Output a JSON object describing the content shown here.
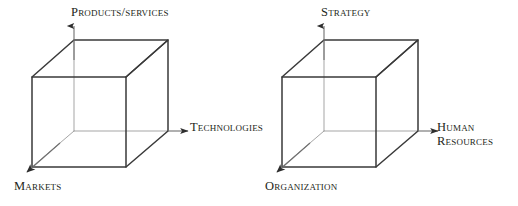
{
  "figure": {
    "type": "diagram",
    "background_color": "#ffffff",
    "stroke_color_visible": "#3a3a3a",
    "stroke_color_hidden": "#9a9a9a",
    "text_color": "#231f20"
  },
  "cubes": [
    {
      "id": "left-cube",
      "name": "business-dimensions-cube",
      "axes": [
        {
          "id": "vertical",
          "direction": "up",
          "label": "Products/services"
        },
        {
          "id": "horizontal",
          "direction": "right",
          "label": "Technologies"
        },
        {
          "id": "depth",
          "direction": "down-left",
          "label": "Markets"
        }
      ]
    },
    {
      "id": "right-cube",
      "name": "organizational-dimensions-cube",
      "axes": [
        {
          "id": "vertical",
          "direction": "up",
          "label": "Strategy"
        },
        {
          "id": "horizontal",
          "direction": "right",
          "label_line1": "Human",
          "label_line2": "Resources"
        },
        {
          "id": "depth",
          "direction": "down-left",
          "label": "Organization"
        }
      ]
    }
  ],
  "labels": {
    "products_services": "Products/services",
    "technologies": "Technologies",
    "markets": "Markets",
    "strategy": "Strategy",
    "human": "Human",
    "resources": "Resources",
    "organization": "Organization"
  }
}
